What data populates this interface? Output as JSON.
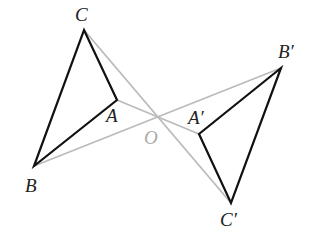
{
  "diagram": {
    "title": "",
    "points": {
      "A": {
        "label": "A",
        "x": 117,
        "y": 100
      },
      "B": {
        "label": "B",
        "x": 34,
        "y": 166
      },
      "C": {
        "label": "C",
        "x": 84,
        "y": 30
      },
      "O": {
        "label": "O",
        "x": 155,
        "y": 118
      },
      "A1": {
        "label": "A′",
        "x": 199,
        "y": 134
      },
      "B1": {
        "label": "B′",
        "x": 281,
        "y": 68
      },
      "C1": {
        "label": "C′",
        "x": 231,
        "y": 203
      }
    },
    "colors": {
      "triangle": "#111111",
      "construction": "#bbbbbb",
      "label": "#222222",
      "center_label": "#aaaaaa"
    }
  }
}
